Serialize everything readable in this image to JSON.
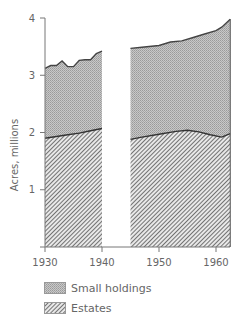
{
  "chart_data": {
    "type": "area",
    "stacked": true,
    "title": "",
    "xlabel": "",
    "ylabel": "Acres, millions",
    "xlim": [
      1930,
      1962.5
    ],
    "ylim": [
      0,
      4
    ],
    "x_ticks": [
      "1930",
      "1940",
      "1950",
      "1960"
    ],
    "y_ticks": [
      "1",
      "2",
      "3",
      "4"
    ],
    "grid": false,
    "gap": [
      1940,
      1945
    ],
    "legend_position": "bottom",
    "series": [
      {
        "name": "Estates",
        "pattern": "diagonal-hatch",
        "segments": [
          {
            "x": [
              1930,
              1932,
              1934,
              1936,
              1938,
              1940
            ],
            "y": [
              1.9,
              1.93,
              1.96,
              1.99,
              2.03,
              2.07
            ]
          },
          {
            "x": [
              1945,
              1947,
              1950,
              1953,
              1955,
              1957,
              1959,
              1961,
              1962.5
            ],
            "y": [
              1.88,
              1.92,
              1.97,
              2.02,
              2.04,
              2.01,
              1.96,
              1.92,
              1.98
            ]
          }
        ]
      },
      {
        "name": "Small holdings",
        "pattern": "stippled-grey",
        "total_segments": [
          {
            "x": [
              1930,
              1931,
              1932,
              1933,
              1934,
              1935,
              1936,
              1937,
              1938,
              1939,
              1940
            ],
            "y": [
              3.12,
              3.17,
              3.17,
              3.25,
              3.15,
              3.15,
              3.26,
              3.27,
              3.27,
              3.38,
              3.42
            ]
          },
          {
            "x": [
              1945,
              1947,
              1950,
              1952,
              1954,
              1956,
              1958,
              1960,
              1961,
              1962.5
            ],
            "y": [
              3.47,
              3.49,
              3.52,
              3.58,
              3.6,
              3.66,
              3.72,
              3.78,
              3.84,
              3.98
            ]
          }
        ]
      }
    ]
  },
  "legend": {
    "items": [
      {
        "label": "Small holdings"
      },
      {
        "label": "Estates"
      }
    ]
  },
  "axis": {
    "ylabel": "Acres, millions",
    "x_ticks": [
      "1930",
      "1940",
      "1950",
      "1960"
    ],
    "y_ticks": [
      "1",
      "2",
      "3",
      "4"
    ]
  }
}
